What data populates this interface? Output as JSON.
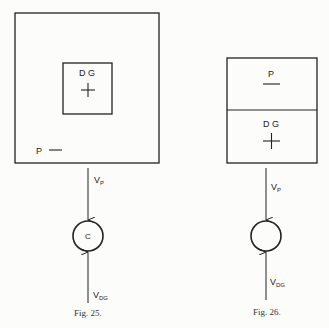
{
  "figures": [
    {
      "caption": "Fig. 25.",
      "outer_box_labels": {
        "dg": "D G",
        "p": "P"
      },
      "circle_label": "C",
      "top_arrow_label": "V",
      "top_arrow_sub": "P",
      "bottom_arrow_label": "V",
      "bottom_arrow_sub": "DG"
    },
    {
      "caption": "Fig. 26.",
      "top_cell_label": "P",
      "bottom_cell_label": "D G",
      "circle_label": "",
      "top_arrow_label": "V",
      "top_arrow_sub": "P",
      "bottom_arrow_label": "V",
      "bottom_arrow_sub": "DG"
    }
  ],
  "colors": {
    "ink": "#222222",
    "paper": "#fcfcfa"
  }
}
